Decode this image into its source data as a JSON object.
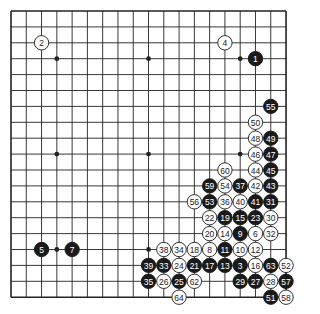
{
  "board": {
    "size": 19,
    "origin_x": 11,
    "origin_y": 11,
    "step_x": 15.28,
    "step_y": 15.9,
    "line_color": "#222222",
    "background": "#ffffff",
    "star_points": [
      [
        3,
        3
      ],
      [
        9,
        3
      ],
      [
        15,
        3
      ],
      [
        3,
        9
      ],
      [
        9,
        9
      ],
      [
        15,
        9
      ],
      [
        3,
        15
      ],
      [
        9,
        15
      ],
      [
        15,
        15
      ]
    ]
  },
  "colors": {
    "black": "#1a1a1a",
    "white": "#ffffff",
    "black_text": "#ffffff",
    "white_text": "#222222"
  },
  "stones": [
    {
      "n": "1",
      "c": "b",
      "x": 16,
      "y": 3
    },
    {
      "n": "2",
      "c": "w",
      "x": 2,
      "y": 2
    },
    {
      "n": "3",
      "c": "b",
      "x": 15,
      "y": 16
    },
    {
      "n": "4",
      "c": "w",
      "x": 14,
      "y": 2
    },
    {
      "n": "5",
      "c": "b",
      "x": 2,
      "y": 15
    },
    {
      "n": "6",
      "c": "w",
      "x": 16,
      "y": 14
    },
    {
      "n": "7",
      "c": "b",
      "x": 4,
      "y": 15
    },
    {
      "n": "8",
      "c": "w",
      "x": 13,
      "y": 15
    },
    {
      "n": "9",
      "c": "b",
      "x": 15,
      "y": 14
    },
    {
      "n": "10",
      "c": "w",
      "x": 15,
      "y": 15
    },
    {
      "n": "11",
      "c": "b",
      "x": 14,
      "y": 15
    },
    {
      "n": "12",
      "c": "w",
      "x": 16,
      "y": 15
    },
    {
      "n": "13",
      "c": "b",
      "x": 14,
      "y": 16
    },
    {
      "n": "14",
      "c": "w",
      "x": 14,
      "y": 14
    },
    {
      "n": "15",
      "c": "b",
      "x": 15,
      "y": 13
    },
    {
      "n": "16",
      "c": "w",
      "x": 16,
      "y": 16
    },
    {
      "n": "17",
      "c": "b",
      "x": 13,
      "y": 16
    },
    {
      "n": "18",
      "c": "w",
      "x": 12,
      "y": 15
    },
    {
      "n": "19",
      "c": "b",
      "x": 14,
      "y": 13
    },
    {
      "n": "20",
      "c": "w",
      "x": 13,
      "y": 14
    },
    {
      "n": "21",
      "c": "b",
      "x": 12,
      "y": 16
    },
    {
      "n": "22",
      "c": "w",
      "x": 13,
      "y": 13
    },
    {
      "n": "23",
      "c": "b",
      "x": 16,
      "y": 13
    },
    {
      "n": "24",
      "c": "w",
      "x": 11,
      "y": 16
    },
    {
      "n": "25",
      "c": "b",
      "x": 11,
      "y": 17
    },
    {
      "n": "26",
      "c": "w",
      "x": 10,
      "y": 17
    },
    {
      "n": "27",
      "c": "b",
      "x": 16,
      "y": 17
    },
    {
      "n": "28",
      "c": "w",
      "x": 17,
      "y": 17
    },
    {
      "n": "29",
      "c": "b",
      "x": 15,
      "y": 17
    },
    {
      "n": "30",
      "c": "w",
      "x": 17,
      "y": 13
    },
    {
      "n": "31",
      "c": "b",
      "x": 17,
      "y": 12
    },
    {
      "n": "32",
      "c": "w",
      "x": 17,
      "y": 14
    },
    {
      "n": "33",
      "c": "b",
      "x": 10,
      "y": 16
    },
    {
      "n": "34",
      "c": "w",
      "x": 11,
      "y": 15
    },
    {
      "n": "35",
      "c": "b",
      "x": 9,
      "y": 17
    },
    {
      "n": "36",
      "c": "w",
      "x": 14,
      "y": 12
    },
    {
      "n": "37",
      "c": "b",
      "x": 15,
      "y": 11
    },
    {
      "n": "38",
      "c": "w",
      "x": 10,
      "y": 15
    },
    {
      "n": "39",
      "c": "b",
      "x": 9,
      "y": 16
    },
    {
      "n": "40",
      "c": "w",
      "x": 15,
      "y": 12
    },
    {
      "n": "41",
      "c": "b",
      "x": 16,
      "y": 12
    },
    {
      "n": "42",
      "c": "w",
      "x": 16,
      "y": 11
    },
    {
      "n": "43",
      "c": "b",
      "x": 17,
      "y": 11
    },
    {
      "n": "44",
      "c": "w",
      "x": 16,
      "y": 10
    },
    {
      "n": "45",
      "c": "b",
      "x": 17,
      "y": 10
    },
    {
      "n": "46",
      "c": "w",
      "x": 16,
      "y": 9
    },
    {
      "n": "47",
      "c": "b",
      "x": 17,
      "y": 9
    },
    {
      "n": "48",
      "c": "w",
      "x": 16,
      "y": 8
    },
    {
      "n": "49",
      "c": "b",
      "x": 17,
      "y": 8
    },
    {
      "n": "50",
      "c": "w",
      "x": 16,
      "y": 7
    },
    {
      "n": "51",
      "c": "b",
      "x": 17,
      "y": 18
    },
    {
      "n": "52",
      "c": "w",
      "x": 18,
      "y": 16
    },
    {
      "n": "53",
      "c": "b",
      "x": 13,
      "y": 12
    },
    {
      "n": "54",
      "c": "w",
      "x": 14,
      "y": 11
    },
    {
      "n": "55",
      "c": "b",
      "x": 17,
      "y": 6
    },
    {
      "n": "56",
      "c": "w",
      "x": 12,
      "y": 12
    },
    {
      "n": "57",
      "c": "b",
      "x": 18,
      "y": 17
    },
    {
      "n": "58",
      "c": "w",
      "x": 18,
      "y": 18
    },
    {
      "n": "59",
      "c": "b",
      "x": 13,
      "y": 11
    },
    {
      "n": "60",
      "c": "w",
      "x": 14,
      "y": 10
    },
    {
      "n": "62",
      "c": "w",
      "x": 12,
      "y": 17
    },
    {
      "n": "63",
      "c": "b",
      "x": 17,
      "y": 16
    },
    {
      "n": "64",
      "c": "w",
      "x": 11,
      "y": 18
    }
  ]
}
